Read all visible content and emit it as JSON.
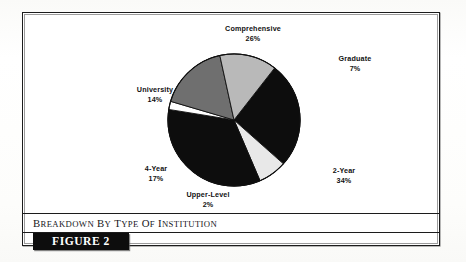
{
  "figure": {
    "caption": "Breakdown by Type of Institution",
    "caption_words": [
      {
        "lead": "B",
        "rest": "REAKDOWN"
      },
      {
        "lead": "B",
        "rest": "Y"
      },
      {
        "lead": "T",
        "rest": "YPE"
      },
      {
        "lead": "O",
        "rest": "F"
      },
      {
        "lead": "I",
        "rest": "NSTITUTION"
      }
    ],
    "tag": "FIGURE 2"
  },
  "chart_data": {
    "type": "pie",
    "title": "Breakdown by Type of Institution",
    "xlabel": "",
    "ylabel": "",
    "legend": "none",
    "grid": false,
    "units": "percent",
    "total": 100,
    "start_angle_deg": -52,
    "direction": "clockwise",
    "categories": [
      "Comprehensive",
      "Graduate",
      "2-Year",
      "Upper-Level",
      "4-Year",
      "University"
    ],
    "values": [
      26,
      7,
      34,
      2,
      17,
      14
    ],
    "labels": [
      "26%",
      "7%",
      "34%",
      "2%",
      "17%",
      "14%"
    ],
    "colors": [
      "#0d0d0d",
      "#e8e8e8",
      "#0d0d0d",
      "#ffffff",
      "#6f6f6f",
      "#b9b9b9"
    ],
    "slices": [
      {
        "name": "Comprehensive",
        "value": 26,
        "label": "26%",
        "color": "#0d0d0d"
      },
      {
        "name": "Graduate",
        "value": 7,
        "label": "7%",
        "color": "#e8e8e8"
      },
      {
        "name": "2-Year",
        "value": 34,
        "label": "34%",
        "color": "#0d0d0d"
      },
      {
        "name": "Upper-Level",
        "value": 2,
        "label": "2%",
        "color": "#ffffff"
      },
      {
        "name": "4-Year",
        "value": 17,
        "label": "17%",
        "color": "#6f6f6f"
      },
      {
        "name": "University",
        "value": 14,
        "label": "14%",
        "color": "#b9b9b9"
      }
    ]
  },
  "labels": {
    "comprehensive": {
      "name": "Comprehensive",
      "pct": "26%"
    },
    "graduate": {
      "name": "Graduate",
      "pct": "7%"
    },
    "two_year": {
      "name": "2-Year",
      "pct": "34%"
    },
    "upper_level": {
      "name": "Upper-Level",
      "pct": "2%"
    },
    "four_year": {
      "name": "4-Year",
      "pct": "17%"
    },
    "university": {
      "name": "University",
      "pct": "14%"
    }
  },
  "colors": {
    "ink": "#0d0d0d",
    "frame": "#1c1c1c",
    "light_gray": "#b9b9b9",
    "mid_gray": "#6f6f6f",
    "pale": "#e8e8e8",
    "page": "#fdfdfd"
  }
}
